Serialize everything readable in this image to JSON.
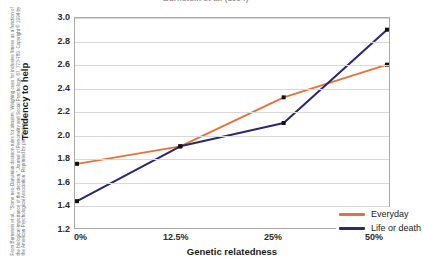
{
  "title_truncated": "Burnstein et al. (1994)",
  "credit": "From Burnstein et al., \"Some neo-Darwinian decision rules for altruism: Weighing cues for inclusive fitness as a function of the biological importance of the decision,\" Journal of Personality and Social Psychology, 67, 773-789. Copyright © 1994 by the American Psychological Association. Reprinted by permission.",
  "colors": {
    "everyday": "#E8713A",
    "life_or_death": "#2A2A6E",
    "gridline": "#D8D8D8",
    "frame": "#A9A9A9",
    "marker": "#111111",
    "background": "#FFFFFF"
  },
  "chart_data": {
    "type": "line",
    "title": "Burnstein et al. (1994)",
    "xlabel": "Genetic relatedness",
    "ylabel": "Tendency to help",
    "categories": [
      "0%",
      "12.5%",
      "25%",
      "50%"
    ],
    "x_positions": [
      0,
      1,
      2,
      3
    ],
    "ylim": [
      1.2,
      3.0
    ],
    "yticks": [
      "3.0",
      "2.8",
      "2.6",
      "2.4",
      "2.2",
      "2.0",
      "1.8",
      "1.6",
      "1.4",
      "1.2"
    ],
    "ytick_values": [
      3.0,
      2.8,
      2.6,
      2.4,
      2.2,
      2.0,
      1.8,
      1.6,
      1.4,
      1.2
    ],
    "grid": "horizontal",
    "legend_position": "inside bottom-right",
    "markers": "small black squares at data points",
    "series": [
      {
        "name": "Everyday",
        "color": "#E8713A",
        "values": [
          1.75,
          1.9,
          2.32,
          2.6
        ]
      },
      {
        "name": "Life or death",
        "color": "#2A2A6E",
        "values": [
          1.43,
          1.9,
          2.1,
          2.9
        ]
      }
    ]
  }
}
